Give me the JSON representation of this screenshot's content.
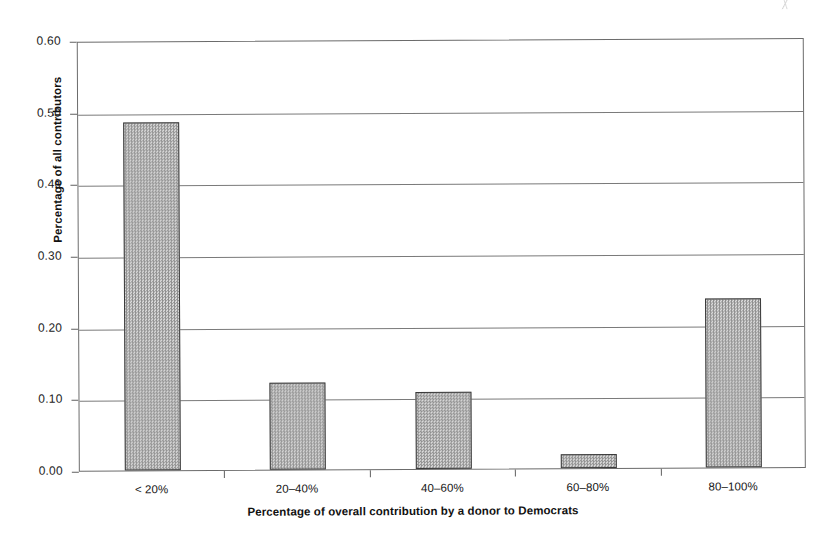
{
  "chart_data": {
    "type": "bar",
    "title": "",
    "subtitle": "",
    "xlabel": "Percentage of overall contribution by a donor to Democrats",
    "ylabel": "Percentage of all contributors",
    "categories": [
      "< 20%",
      "20–40%",
      "40–60%",
      "60–80%",
      "80–100%"
    ],
    "values": [
      0.485,
      0.121,
      0.108,
      0.019,
      0.236
    ],
    "series": [
      {
        "name": "Percentage of all contributors",
        "values": [
          0.485,
          0.121,
          0.108,
          0.019,
          0.236
        ]
      }
    ],
    "ylim": [
      0.0,
      0.6
    ],
    "ytick_labels": [
      "0.00",
      "0.10",
      "0.20",
      "0.30",
      "0.40",
      "0.50",
      "0.60"
    ],
    "ytick_values": [
      0.0,
      0.1,
      0.2,
      0.3,
      0.4,
      0.5,
      0.6
    ],
    "grid": "horizontal",
    "legend": "none",
    "bar_fill": "#b9b9b9",
    "bar_edge": "#3a3a3a",
    "axis_color": "#6b6b6b",
    "background": "#ffffff"
  }
}
